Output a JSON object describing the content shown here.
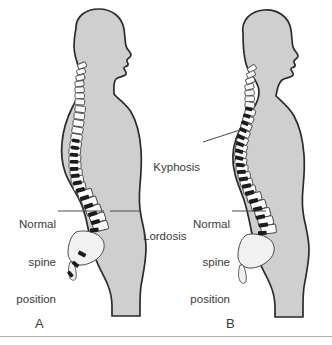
{
  "figure": {
    "background_color": "#ffffff",
    "baseline_color": "#b2b2b2",
    "text_color": "#3a3a3a"
  },
  "colors": {
    "body_fill": "#cfcfcf",
    "body_outline": "#2b2b2b",
    "vertebra_fill": "#fdfdfd",
    "vertebra_outline": "#4a4a4a",
    "disc_fill": "#1c1c1c",
    "sacrum_fill": "#f2f2f2",
    "leader_line": "#4a4a4a"
  },
  "panels": [
    {
      "id": "A",
      "letter": "A",
      "description": "Normal spine position with natural lordosis",
      "labels": [
        {
          "id": "normal-spine-position-a",
          "lines": [
            "Normal",
            "spine",
            "position"
          ],
          "text": "Normal spine position",
          "align": "right"
        },
        {
          "id": "lordosis",
          "lines": [
            "Lordosis"
          ],
          "text": "Lordosis",
          "align": "left"
        }
      ]
    },
    {
      "id": "B",
      "letter": "B",
      "description": "Abnormal spine with kyphosis, exaggerated thoracic curve",
      "labels": [
        {
          "id": "kyphosis",
          "lines": [
            "Kyphosis"
          ],
          "text": "Kyphosis",
          "align": "right"
        },
        {
          "id": "normal-spine-position-b",
          "lines": [
            "Normal",
            "spine",
            "position"
          ],
          "text": "Normal spine position",
          "align": "right"
        }
      ]
    }
  ],
  "label_text": {
    "normal": "Normal",
    "spine": "spine",
    "position": "position",
    "lordosis": "Lordosis",
    "kyphosis": "Kyphosis",
    "letter_a": "A",
    "letter_b": "B"
  }
}
